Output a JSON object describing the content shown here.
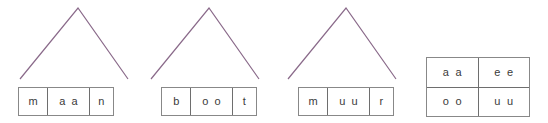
{
  "figure": {
    "background_color": "#ffffff",
    "caret_color": "#8a6a8a",
    "box_border_color": "#888888",
    "cell_divider_color": "#6e6e6e",
    "text_color": "#3a3a3a"
  },
  "words": [
    {
      "word": "maan",
      "caret": {
        "apex_x": 78,
        "apex_y": 8,
        "left_x": 20,
        "right_x": 128,
        "base_y": 79
      },
      "box": {
        "x": 18,
        "y": 87,
        "width": 96,
        "height": 29
      },
      "cells": [
        {
          "text": "m",
          "width": 30
        },
        {
          "text": "a a",
          "width": 42
        },
        {
          "text": "n",
          "width": 24
        }
      ]
    },
    {
      "word": "boot",
      "caret": {
        "apex_x": 209,
        "apex_y": 8,
        "left_x": 151,
        "right_x": 259,
        "base_y": 79
      },
      "box": {
        "x": 161,
        "y": 87,
        "width": 96,
        "height": 29
      },
      "cells": [
        {
          "text": "b",
          "width": 30
        },
        {
          "text": "o o",
          "width": 42
        },
        {
          "text": "t",
          "width": 24
        }
      ]
    },
    {
      "word": "muur",
      "caret": {
        "apex_x": 346,
        "apex_y": 8,
        "left_x": 288,
        "right_x": 396,
        "base_y": 79
      },
      "box": {
        "x": 298,
        "y": 87,
        "width": 96,
        "height": 29
      },
      "cells": [
        {
          "text": "m",
          "width": 30
        },
        {
          "text": "u u",
          "width": 42
        },
        {
          "text": "r",
          "width": 24
        }
      ]
    }
  ],
  "vowel_table": {
    "x": 426,
    "y": 57,
    "width": 104,
    "height": 60,
    "rows": [
      [
        "a a",
        "e e"
      ],
      [
        "o o",
        "u u"
      ]
    ]
  }
}
